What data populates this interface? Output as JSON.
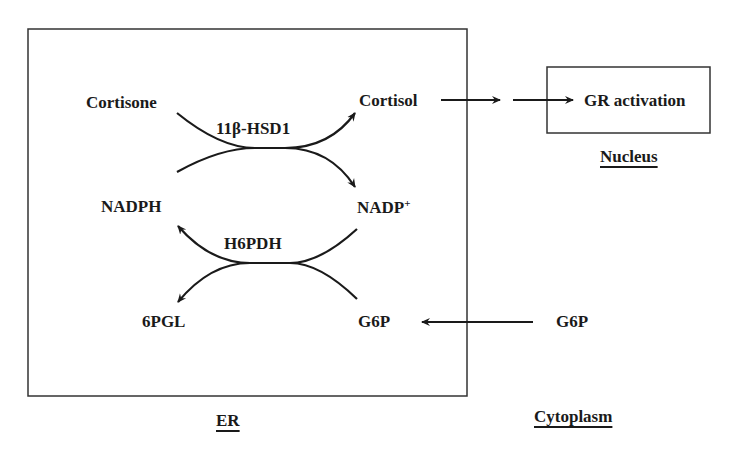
{
  "diagram": {
    "compartments": {
      "er": "ER",
      "nucleus": "Nucleus",
      "cytoplasm": "Cytoplasm"
    },
    "molecules": {
      "cortisone": "Cortisone",
      "cortisol": "Cortisol",
      "nadph": "NADPH",
      "nadp_plus_base": "NADP",
      "nadp_plus_sup": "+",
      "sixpgl": "6PGL",
      "g6p_er": "G6P",
      "g6p_cytoplasm": "G6P"
    },
    "enzymes": {
      "hsd1": "11β-HSD1",
      "h6pdh": "H6PDH"
    },
    "outputs": {
      "gr_activation": "GR activation"
    },
    "colors": {
      "line": "#1a1a1a",
      "background": "#ffffff"
    }
  }
}
